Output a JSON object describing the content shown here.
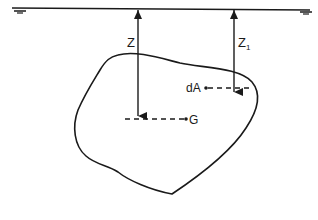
{
  "diagram": {
    "type": "hydrostatic-force-on-submerged-plane-surface",
    "colors": {
      "stroke": "#1a1a1a",
      "background": "#ffffff"
    },
    "labels": {
      "depth_centroid": "Z",
      "depth_element_main": "Z",
      "depth_element_sub": "1",
      "element_area": "dA",
      "centroid": "G"
    },
    "elements": [
      {
        "id": "free-surface",
        "kind": "line",
        "description": "free liquid surface with water-level symbols"
      },
      {
        "id": "depth-arrow-z",
        "kind": "arrow",
        "label": "Z",
        "from": "free-surface",
        "to": "centroid-G"
      },
      {
        "id": "depth-arrow-z1",
        "kind": "arrow",
        "label": "Z1",
        "from": "free-surface",
        "to": "element-dA"
      },
      {
        "id": "plane-area",
        "kind": "closed-curve",
        "description": "submerged irregular plane area"
      },
      {
        "id": "element-dA",
        "kind": "point",
        "label": "dA"
      },
      {
        "id": "centroid-G",
        "kind": "point",
        "label": "G"
      }
    ]
  }
}
